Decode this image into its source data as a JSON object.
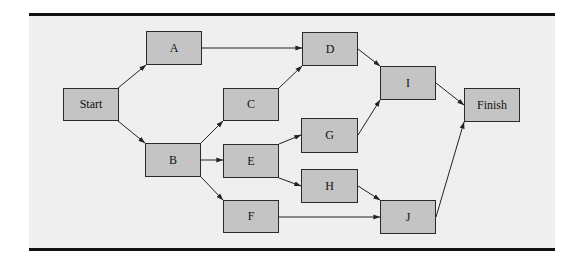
{
  "diagram": {
    "type": "activity-network",
    "colors": {
      "background": "#efefef",
      "node_fill": "#c4c4c4",
      "node_border": "#2a2a2a",
      "edge": "#222222",
      "rule": "#111111"
    },
    "nodes": [
      {
        "id": "start",
        "label": "Start",
        "x": 63,
        "y": 88,
        "w": 56,
        "h": 33
      },
      {
        "id": "a",
        "label": "A",
        "x": 146,
        "y": 31,
        "w": 56,
        "h": 34
      },
      {
        "id": "b",
        "label": "B",
        "x": 145,
        "y": 143,
        "w": 56,
        "h": 34
      },
      {
        "id": "c",
        "label": "C",
        "x": 223,
        "y": 88,
        "w": 56,
        "h": 33
      },
      {
        "id": "e",
        "label": "E",
        "x": 223,
        "y": 144,
        "w": 56,
        "h": 34
      },
      {
        "id": "f",
        "label": "F",
        "x": 223,
        "y": 200,
        "w": 56,
        "h": 33
      },
      {
        "id": "d",
        "label": "D",
        "x": 302,
        "y": 32,
        "w": 56,
        "h": 34
      },
      {
        "id": "g",
        "label": "G",
        "x": 301,
        "y": 118,
        "w": 57,
        "h": 35
      },
      {
        "id": "h",
        "label": "H",
        "x": 301,
        "y": 169,
        "w": 57,
        "h": 34
      },
      {
        "id": "i",
        "label": "I",
        "x": 380,
        "y": 66,
        "w": 56,
        "h": 34
      },
      {
        "id": "j",
        "label": "J",
        "x": 380,
        "y": 200,
        "w": 56,
        "h": 34
      },
      {
        "id": "finish",
        "label": "Finish",
        "x": 464,
        "y": 88,
        "w": 56,
        "h": 34
      }
    ],
    "edges": [
      {
        "from": "start",
        "to": "a",
        "x1": 118,
        "y1": 88,
        "x2": 146,
        "y2": 65
      },
      {
        "from": "start",
        "to": "b",
        "x1": 118,
        "y1": 121,
        "x2": 145,
        "y2": 143
      },
      {
        "from": "a",
        "to": "d",
        "x1": 202,
        "y1": 48,
        "x2": 302,
        "y2": 48
      },
      {
        "from": "b",
        "to": "c",
        "x1": 201,
        "y1": 143,
        "x2": 223,
        "y2": 121
      },
      {
        "from": "b",
        "to": "e",
        "x1": 201,
        "y1": 160,
        "x2": 223,
        "y2": 160
      },
      {
        "from": "b",
        "to": "f",
        "x1": 201,
        "y1": 177,
        "x2": 223,
        "y2": 200
      },
      {
        "from": "c",
        "to": "d",
        "x1": 279,
        "y1": 88,
        "x2": 302,
        "y2": 66
      },
      {
        "from": "d",
        "to": "i",
        "x1": 358,
        "y1": 49,
        "x2": 380,
        "y2": 66
      },
      {
        "from": "e",
        "to": "g",
        "x1": 279,
        "y1": 144,
        "x2": 301,
        "y2": 135
      },
      {
        "from": "e",
        "to": "h",
        "x1": 279,
        "y1": 178,
        "x2": 301,
        "y2": 186
      },
      {
        "from": "g",
        "to": "i",
        "x1": 358,
        "y1": 135,
        "x2": 380,
        "y2": 100
      },
      {
        "from": "h",
        "to": "j",
        "x1": 358,
        "y1": 186,
        "x2": 380,
        "y2": 200
      },
      {
        "from": "f",
        "to": "j",
        "x1": 279,
        "y1": 217,
        "x2": 380,
        "y2": 217
      },
      {
        "from": "i",
        "to": "finish",
        "x1": 436,
        "y1": 83,
        "x2": 464,
        "y2": 105
      },
      {
        "from": "j",
        "to": "finish",
        "x1": 436,
        "y1": 217,
        "x2": 464,
        "y2": 122
      }
    ]
  },
  "labels": {
    "start": "Start",
    "a": "A",
    "b": "B",
    "c": "C",
    "d": "D",
    "e": "E",
    "f": "F",
    "g": "G",
    "h": "H",
    "i": "I",
    "j": "J",
    "finish": "Finish"
  }
}
